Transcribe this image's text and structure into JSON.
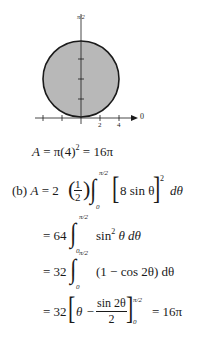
{
  "figure": {
    "axis_top_label": "π/2",
    "axis_right_label": "0",
    "tick_labels": [
      "2",
      "4"
    ],
    "fill_color": "#b8b8b8",
    "stroke_color": "#1a1a1a"
  },
  "part_a": {
    "lhs": "A",
    "eq1": "=",
    "pi_expr": "π(4)",
    "exp": "2",
    "eq2": "=",
    "result": "16π"
  },
  "part_b": {
    "label": "(b)",
    "lhs": "A",
    "eq": "=",
    "coef": "2",
    "half_num": "1",
    "half_den": "2",
    "upper": "π/2",
    "lower": "0",
    "integrand": "8 sin θ",
    "power": "2",
    "dtheta": "dθ",
    "step2": {
      "eq": "=",
      "coef": "64",
      "upper": "π/2",
      "lower": "0",
      "integrand": "sin",
      "exp": "2",
      "rest": "θ dθ"
    },
    "step3": {
      "eq": "=",
      "coef": "32",
      "upper": "π/2",
      "lower": "0",
      "integrand": "(1 − cos 2θ) dθ"
    },
    "step4": {
      "eq": "=",
      "coef": "32",
      "theta": "θ −",
      "num": "sin 2θ",
      "den": "2",
      "upper": "π/2",
      "lower": "0",
      "eq2": "=",
      "result": "16π"
    }
  }
}
